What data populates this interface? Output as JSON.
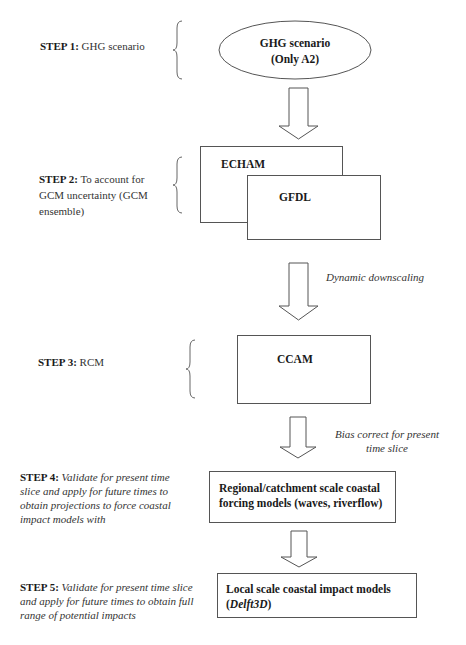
{
  "steps": [
    {
      "label": "STEP 1:",
      "text": "GHG scenario"
    },
    {
      "label": "STEP 2:",
      "text": "To account for GCM uncertainty (GCM ensemble)"
    },
    {
      "label": "STEP 3:",
      "text": "RCM"
    },
    {
      "label": "STEP 4:",
      "text": "Validate for present time slice and apply for future times to obtain projections to force coastal impact models with"
    },
    {
      "label": "STEP 5:",
      "text": "Validate for present time slice and apply for future times to obtain full range of potential impacts"
    }
  ],
  "nodes": {
    "ghg": {
      "line1": "GHG scenario",
      "line2": "(Only A2)"
    },
    "echam": "ECHAM",
    "gfdl": "GFDL",
    "ccam": "CCAM",
    "regional": {
      "line1": "Regional/catchment scale coastal",
      "line2": "forcing models (waves, riverflow)"
    },
    "local": {
      "line1": "Local scale coastal impact models",
      "line2_open": "(",
      "line2_italic": "Delft3D",
      "line2_close": ")"
    }
  },
  "arrow_labels": {
    "downscaling": "Dynamic downscaling",
    "bias_line1": "Bias correct for present",
    "bias_line2": "time slice"
  }
}
